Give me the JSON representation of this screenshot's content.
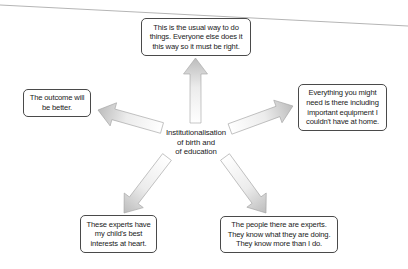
{
  "diagram": {
    "center": {
      "lines": [
        "Institutionalisation",
        "of birth and",
        "of education"
      ]
    },
    "nodes": {
      "top": {
        "lines": [
          "This is the usual way to do",
          "things. Everyone else does it",
          "this way so it must be right."
        ]
      },
      "left": {
        "lines": [
          "The outcome will",
          "be better."
        ]
      },
      "right": {
        "lines": [
          "Everything you might",
          "need is there including",
          "important equipment I",
          "couldn't have at home."
        ]
      },
      "bottom_left": {
        "lines": [
          "These experts have",
          "my child's best",
          "interests at heart."
        ]
      },
      "bottom_right": {
        "lines": [
          "The people there are experts.",
          "They know what they are doing.",
          "They know more than I do."
        ]
      }
    },
    "arrows": [
      {
        "from": "center",
        "to": "top",
        "icon": "arrow-icon"
      },
      {
        "from": "center",
        "to": "left",
        "icon": "arrow-icon"
      },
      {
        "from": "center",
        "to": "right",
        "icon": "arrow-icon"
      },
      {
        "from": "center",
        "to": "bottom_left",
        "icon": "arrow-icon"
      },
      {
        "from": "center",
        "to": "bottom_right",
        "icon": "arrow-icon"
      }
    ],
    "colors": {
      "box_border": "#4a4a4a",
      "arrow_fill_tip": "#bcbcbc",
      "arrow_fill_tail": "#ffffff",
      "arrow_outline": "#9a9a9a",
      "page_edge_line": "#b5b5b5"
    }
  }
}
